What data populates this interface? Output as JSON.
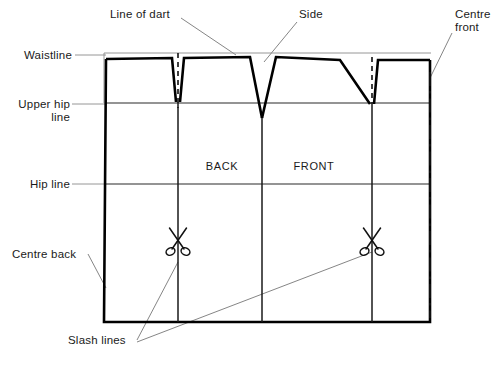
{
  "diagram": {
    "type": "sewing-pattern-technical-drawing",
    "colors": {
      "outline": "#000000",
      "guide": "#2b2b2b",
      "leader": "#777777",
      "background": "#ffffff",
      "text": "#1a1a1a"
    },
    "labels": {
      "waistline": "Waistline",
      "upper_hip_line_1": "Upper hip",
      "upper_hip_line_2": "line",
      "hip_line": "Hip line",
      "centre_back": "Centre back",
      "line_of_dart": "Line of dart",
      "side": "Side",
      "centre_front_1": "Centre",
      "centre_front_2": "front",
      "slash_lines": "Slash lines",
      "back": "BACK",
      "front": "FRONT"
    },
    "horizontal_guides": [
      {
        "name": "waistline",
        "label": "Waistline",
        "y": 53
      },
      {
        "name": "upper-hip-line",
        "label": "Upper hip line",
        "y": 103
      },
      {
        "name": "hip-line",
        "label": "Hip line",
        "y": 184
      }
    ],
    "vertical_slash_lines": [
      {
        "name": "back-dart-slash",
        "x": 178
      },
      {
        "name": "side-seam-slash",
        "x": 262
      },
      {
        "name": "front-dart-slash",
        "x": 372
      }
    ],
    "scissors": [
      {
        "name": "scissors-back",
        "x": 178,
        "y": 242
      },
      {
        "name": "scissors-front",
        "x": 372,
        "y": 242
      }
    ],
    "pattern_bounds": {
      "left": 105,
      "right": 430,
      "top": 53,
      "bottom": 322
    },
    "piece_labels": [
      {
        "name": "back",
        "text": "BACK",
        "x": 222,
        "y": 170
      },
      {
        "name": "front",
        "text": "FRONT",
        "x": 314,
        "y": 170
      }
    ],
    "darts": [
      {
        "name": "back-dart",
        "apex_x": 178,
        "apex_y": 114,
        "style": "dashed-centre"
      },
      {
        "name": "side-dart",
        "apex_x": 262,
        "apex_y": 118,
        "style": "deep-v"
      },
      {
        "name": "front-dart",
        "apex_x": 372,
        "apex_y": 106,
        "style": "dashed-centre"
      }
    ],
    "centre_front_line": {
      "name": "centre-front",
      "x": 430,
      "style": "dash-dot"
    }
  }
}
